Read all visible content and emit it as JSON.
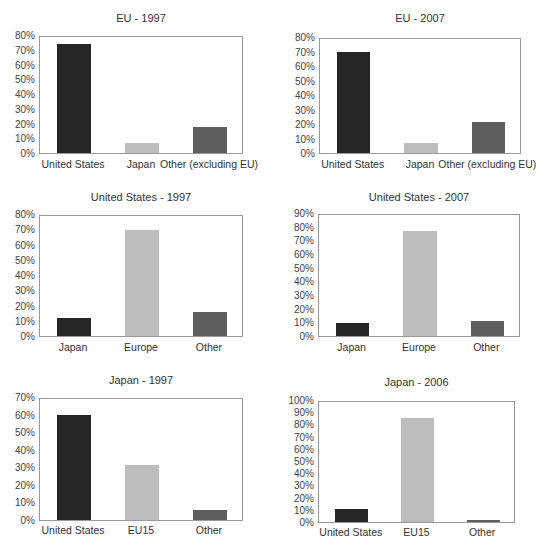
{
  "colors": {
    "dark": "#262626",
    "light": "#bdbdbd",
    "mid": "#5e5e5e"
  },
  "chart_data": [
    {
      "type": "bar",
      "title": "EU - 1997",
      "categories": [
        "United States",
        "Japan",
        "Other (excluding EU)"
      ],
      "values": [
        0.75,
        0.07,
        0.18
      ],
      "bar_colors": [
        "dark",
        "light",
        "mid"
      ],
      "ylim": [
        0,
        0.8
      ],
      "yticks": [
        "0%",
        "10%",
        "20%",
        "30%",
        "40%",
        "50%",
        "60%",
        "70%",
        "80%"
      ],
      "xlabel": "",
      "ylabel": "",
      "grid": false,
      "legend": "none"
    },
    {
      "type": "bar",
      "title": "EU - 2007",
      "categories": [
        "United States",
        "Japan",
        "Other (excluding EU)"
      ],
      "values": [
        0.71,
        0.07,
        0.22
      ],
      "bar_colors": [
        "dark",
        "light",
        "mid"
      ],
      "ylim": [
        0,
        0.8
      ],
      "yticks": [
        "0%",
        "10%",
        "20%",
        "30%",
        "40%",
        "50%",
        "60%",
        "70%",
        "80%"
      ],
      "xlabel": "",
      "ylabel": "",
      "grid": false,
      "legend": "none"
    },
    {
      "type": "bar",
      "title": "United States - 1997",
      "categories": [
        "Japan",
        "Europe",
        "Other"
      ],
      "values": [
        0.12,
        0.71,
        0.16
      ],
      "bar_colors": [
        "dark",
        "light",
        "mid"
      ],
      "ylim": [
        0,
        0.8
      ],
      "yticks": [
        "0%",
        "10%",
        "20%",
        "30%",
        "40%",
        "50%",
        "60%",
        "70%",
        "80%"
      ],
      "xlabel": "",
      "ylabel": "",
      "grid": false,
      "legend": "none"
    },
    {
      "type": "bar",
      "title": "United States - 2007",
      "categories": [
        "Japan",
        "Europe",
        "Other"
      ],
      "values": [
        0.1,
        0.78,
        0.11
      ],
      "bar_colors": [
        "dark",
        "light",
        "mid"
      ],
      "ylim": [
        0,
        0.9
      ],
      "yticks": [
        "0%",
        "10%",
        "20%",
        "30%",
        "40%",
        "50%",
        "60%",
        "70%",
        "80%",
        "90%"
      ],
      "xlabel": "",
      "ylabel": "",
      "grid": false,
      "legend": "none"
    },
    {
      "type": "bar",
      "title": "Japan - 1997",
      "categories": [
        "United States",
        "EU15",
        "Other"
      ],
      "values": [
        0.61,
        0.32,
        0.06
      ],
      "bar_colors": [
        "dark",
        "light",
        "mid"
      ],
      "ylim": [
        0,
        0.7
      ],
      "yticks": [
        "0%",
        "10%",
        "20%",
        "30%",
        "40%",
        "50%",
        "60%",
        "70%"
      ],
      "xlabel": "",
      "ylabel": "",
      "grid": false,
      "legend": "none"
    },
    {
      "type": "bar",
      "title": "Japan - 2006",
      "categories": [
        "United States",
        "EU15",
        "Other"
      ],
      "values": [
        0.11,
        0.87,
        0.01
      ],
      "bar_colors": [
        "dark",
        "light",
        "mid"
      ],
      "ylim": [
        0,
        1.0
      ],
      "yticks": [
        "0%",
        "10%",
        "20%",
        "30%",
        "40%",
        "50%",
        "60%",
        "70%",
        "80%",
        "90%",
        "100%"
      ],
      "xlabel": "",
      "ylabel": "",
      "grid": false,
      "legend": "none"
    }
  ]
}
